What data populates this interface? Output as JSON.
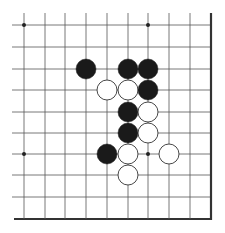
{
  "diagram": {
    "type": "go-board-fragment",
    "columns": 10,
    "rows": 10,
    "column_x": [
      24,
      45,
      65,
      86,
      107,
      128,
      148,
      169,
      190,
      211
    ],
    "row_y": [
      25,
      47,
      69,
      90,
      112,
      133,
      154,
      175,
      197,
      219
    ],
    "open_edges": [
      "top",
      "left"
    ],
    "board_edges": [
      "right",
      "bottom"
    ],
    "colors": {
      "background": "#ffffff",
      "line": "#555555",
      "edge": "#333333",
      "black_stone": "#1a1a1a",
      "white_stone": "#ffffff",
      "white_stone_outline": "#333333"
    },
    "star_points": [
      {
        "col": 0,
        "row": 0
      },
      {
        "col": 6,
        "row": 0
      },
      {
        "col": 0,
        "row": 6
      },
      {
        "col": 6,
        "row": 6
      }
    ],
    "stones": [
      {
        "color": "black",
        "col": 3,
        "row": 2
      },
      {
        "color": "black",
        "col": 5,
        "row": 2
      },
      {
        "color": "black",
        "col": 6,
        "row": 2
      },
      {
        "color": "white",
        "col": 4,
        "row": 3
      },
      {
        "color": "white",
        "col": 5,
        "row": 3
      },
      {
        "color": "black",
        "col": 6,
        "row": 3
      },
      {
        "color": "black",
        "col": 5,
        "row": 4
      },
      {
        "color": "white",
        "col": 6,
        "row": 4
      },
      {
        "color": "black",
        "col": 5,
        "row": 5
      },
      {
        "color": "white",
        "col": 6,
        "row": 5
      },
      {
        "color": "black",
        "col": 4,
        "row": 6
      },
      {
        "color": "white",
        "col": 5,
        "row": 6
      },
      {
        "color": "white",
        "col": 7,
        "row": 6
      },
      {
        "color": "white",
        "col": 5,
        "row": 7
      }
    ]
  }
}
